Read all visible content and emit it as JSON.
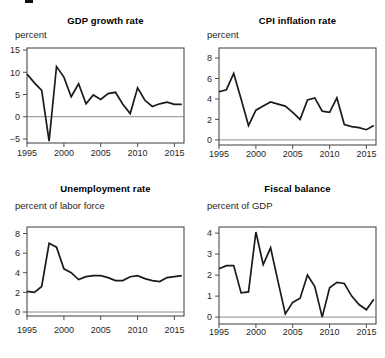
{
  "figure": {
    "background": "#ffffff",
    "text_color": "#1f1f1f",
    "title_color": "#000000",
    "line_color": "#1a1a1a"
  },
  "chart_data": [
    {
      "type": "line",
      "title": "GDP growth rate",
      "unit_label": "percent",
      "x": [
        1995,
        1996,
        1997,
        1998,
        1999,
        2000,
        2001,
        2002,
        2003,
        2004,
        2005,
        2006,
        2007,
        2008,
        2009,
        2010,
        2011,
        2012,
        2013,
        2014,
        2015,
        2016
      ],
      "values": [
        9.6,
        7.6,
        5.9,
        -5.5,
        11.3,
        8.9,
        4.5,
        7.4,
        2.9,
        4.9,
        3.9,
        5.2,
        5.5,
        2.8,
        0.7,
        6.5,
        3.7,
        2.3,
        2.9,
        3.3,
        2.8,
        2.8
      ],
      "xticks": [
        1995,
        2000,
        2005,
        2010,
        2015
      ],
      "yticks": [
        -5,
        0,
        5,
        10,
        15
      ],
      "ylim": [
        -5.9,
        15.45
      ],
      "xlim": [
        1995,
        2016.3
      ],
      "zero_line": 0,
      "grid": false,
      "legend": "none"
    },
    {
      "type": "line",
      "title": "CPI inflation rate",
      "unit_label": "percent",
      "x": [
        1995,
        1996,
        1997,
        1998,
        1999,
        2000,
        2001,
        2002,
        2003,
        2004,
        2005,
        2006,
        2007,
        2008,
        2009,
        2010,
        2011,
        2012,
        2013,
        2014,
        2015,
        2016
      ],
      "values": [
        4.7,
        4.9,
        6.5,
        4.0,
        1.4,
        2.9,
        3.3,
        3.7,
        3.5,
        3.3,
        2.7,
        2.0,
        3.9,
        4.1,
        2.8,
        2.7,
        4.1,
        1.5,
        1.3,
        1.2,
        1.0,
        1.4
      ],
      "xticks": [
        1995,
        2000,
        2005,
        2010,
        2015
      ],
      "yticks": [
        0,
        2,
        4,
        6,
        8
      ],
      "ylim": [
        -0.5,
        8.98
      ],
      "xlim": [
        1995,
        2016.3
      ],
      "zero_line": 0,
      "grid": false,
      "legend": "none"
    },
    {
      "type": "line",
      "title": "Unemployment rate",
      "unit_label": "percent of labor force",
      "x": [
        1995,
        1996,
        1997,
        1998,
        1999,
        2000,
        2001,
        2002,
        2003,
        2004,
        2005,
        2006,
        2007,
        2008,
        2009,
        2010,
        2011,
        2012,
        2013,
        2014,
        2015,
        2016
      ],
      "values": [
        2.1,
        2.0,
        2.6,
        7.0,
        6.6,
        4.4,
        4.0,
        3.3,
        3.6,
        3.7,
        3.7,
        3.5,
        3.2,
        3.2,
        3.6,
        3.7,
        3.4,
        3.2,
        3.1,
        3.5,
        3.6,
        3.7
      ],
      "xticks": [
        1995,
        2000,
        2005,
        2010,
        2015
      ],
      "yticks": [
        0,
        2,
        4,
        6,
        8
      ],
      "ylim": [
        -0.41,
        8.66
      ],
      "xlim": [
        1995,
        2016.3
      ],
      "zero_line": 0,
      "grid": false,
      "legend": "none"
    },
    {
      "type": "line",
      "title": "Fiscal balance",
      "unit_label": "percent of GDP",
      "x": [
        1995,
        1996,
        1997,
        1998,
        1999,
        2000,
        2001,
        2002,
        2003,
        2004,
        2005,
        2006,
        2007,
        2008,
        2009,
        2010,
        2011,
        2012,
        2013,
        2014,
        2015,
        2016
      ],
      "values": [
        2.3,
        2.45,
        2.45,
        1.15,
        1.2,
        4.05,
        2.5,
        3.3,
        1.7,
        0.15,
        0.7,
        0.9,
        2.0,
        1.45,
        0.0,
        1.4,
        1.65,
        1.6,
        1.0,
        0.6,
        0.35,
        0.85
      ],
      "xticks": [
        1995,
        2000,
        2005,
        2010,
        2015
      ],
      "yticks": [
        0,
        1,
        2,
        3,
        4
      ],
      "ylim": [
        -0.33,
        4.29
      ],
      "xlim": [
        1995,
        2016.3
      ],
      "zero_line": 0,
      "grid": false,
      "legend": "none"
    }
  ]
}
